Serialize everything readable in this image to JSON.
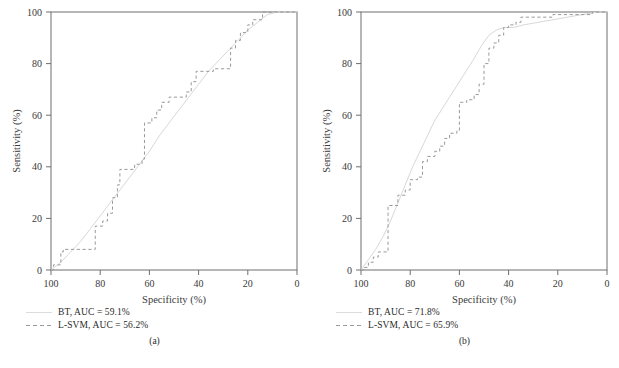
{
  "figure": {
    "background": "#ffffff",
    "axis_color": "#6e6e6e",
    "bt_color": "#d8d8d8",
    "lsvm_color": "#9a9a9a"
  },
  "chart_data": [
    {
      "type": "line",
      "title": "",
      "caption": "(a)",
      "xlabel": "Specificity (%)",
      "ylabel": "Sensitivity (%)",
      "xlim": [
        100,
        0
      ],
      "ylim": [
        0,
        100
      ],
      "xticks": [
        100,
        80,
        60,
        40,
        20,
        0
      ],
      "yticks": [
        0,
        20,
        40,
        60,
        80,
        100
      ],
      "grid": false,
      "legend_position": "below",
      "series": [
        {
          "name": "BT",
          "label": "BT, AUC = 59.1%",
          "auc": 59.1,
          "style": "solid",
          "color": "#d8d8d8",
          "points": [
            [
              100,
              0
            ],
            [
              96,
              3
            ],
            [
              92,
              7
            ],
            [
              88,
              11
            ],
            [
              84,
              16
            ],
            [
              80,
              21
            ],
            [
              76,
              26
            ],
            [
              72,
              31
            ],
            [
              68,
              36
            ],
            [
              64,
              41
            ],
            [
              60,
              46
            ],
            [
              56,
              52
            ],
            [
              52,
              57
            ],
            [
              48,
              62
            ],
            [
              44,
              67
            ],
            [
              40,
              72
            ],
            [
              36,
              77
            ],
            [
              32,
              81
            ],
            [
              28,
              85
            ],
            [
              24,
              89
            ],
            [
              20,
              93
            ],
            [
              16,
              96
            ],
            [
              12,
              99
            ],
            [
              8,
              100
            ],
            [
              4,
              100
            ],
            [
              0,
              100
            ]
          ]
        },
        {
          "name": "L-SVM",
          "label": "L-SVM, AUC = 56.2%",
          "auc": 56.2,
          "style": "dashed",
          "color": "#9a9a9a",
          "points": [
            [
              100,
              0
            ],
            [
              99,
              0
            ],
            [
              99,
              2
            ],
            [
              96,
              2
            ],
            [
              96,
              7
            ],
            [
              95,
              7
            ],
            [
              95,
              8
            ],
            [
              82,
              8
            ],
            [
              82,
              17
            ],
            [
              79,
              17
            ],
            [
              79,
              19
            ],
            [
              77,
              19
            ],
            [
              77,
              22
            ],
            [
              75,
              22
            ],
            [
              75,
              28
            ],
            [
              73,
              28
            ],
            [
              73,
              33
            ],
            [
              72,
              33
            ],
            [
              72,
              39
            ],
            [
              66,
              39
            ],
            [
              66,
              41
            ],
            [
              63,
              41
            ],
            [
              63,
              43
            ],
            [
              62,
              43
            ],
            [
              62,
              57
            ],
            [
              59,
              57
            ],
            [
              59,
              59
            ],
            [
              57,
              59
            ],
            [
              57,
              62
            ],
            [
              55,
              62
            ],
            [
              55,
              65
            ],
            [
              52,
              65
            ],
            [
              52,
              67
            ],
            [
              45,
              67
            ],
            [
              45,
              69
            ],
            [
              43,
              69
            ],
            [
              43,
              73
            ],
            [
              41,
              73
            ],
            [
              41,
              77
            ],
            [
              34,
              77
            ],
            [
              34,
              78
            ],
            [
              27,
              78
            ],
            [
              27,
              86
            ],
            [
              25,
              86
            ],
            [
              25,
              89
            ],
            [
              23,
              89
            ],
            [
              23,
              92
            ],
            [
              20,
              92
            ],
            [
              20,
              95
            ],
            [
              18,
              95
            ],
            [
              18,
              97
            ],
            [
              14,
              97
            ],
            [
              14,
              100
            ],
            [
              0,
              100
            ]
          ]
        }
      ]
    },
    {
      "type": "line",
      "title": "",
      "caption": "(b)",
      "xlabel": "Specificity (%)",
      "ylabel": "Sensitivity (%)",
      "xlim": [
        100,
        0
      ],
      "ylim": [
        0,
        100
      ],
      "xticks": [
        100,
        80,
        60,
        40,
        20,
        0
      ],
      "yticks": [
        0,
        20,
        40,
        60,
        80,
        100
      ],
      "grid": false,
      "legend_position": "below",
      "series": [
        {
          "name": "BT",
          "label": "BT, AUC = 71.8%",
          "auc": 71.8,
          "style": "solid",
          "color": "#d8d8d8",
          "points": [
            [
              100,
              0
            ],
            [
              97,
              4
            ],
            [
              94,
              8
            ],
            [
              91,
              13
            ],
            [
              88,
              19
            ],
            [
              85,
              26
            ],
            [
              82,
              33
            ],
            [
              79,
              40
            ],
            [
              76,
              46
            ],
            [
              73,
              52
            ],
            [
              70,
              58
            ],
            [
              66,
              64
            ],
            [
              62,
              70
            ],
            [
              58,
              76
            ],
            [
              54,
              82
            ],
            [
              51,
              87
            ],
            [
              48,
              91
            ],
            [
              45,
              93
            ],
            [
              42,
              94
            ],
            [
              38,
              94
            ],
            [
              34,
              95
            ],
            [
              28,
              96
            ],
            [
              22,
              97
            ],
            [
              16,
              98
            ],
            [
              10,
              99
            ],
            [
              4,
              100
            ],
            [
              0,
              100
            ]
          ]
        },
        {
          "name": "L-SVM",
          "label": "L-SVM, AUC = 65.9%",
          "auc": 65.9,
          "style": "dashed",
          "color": "#9a9a9a",
          "points": [
            [
              100,
              0
            ],
            [
              99,
              0
            ],
            [
              99,
              1
            ],
            [
              97,
              1
            ],
            [
              97,
              3
            ],
            [
              95,
              3
            ],
            [
              95,
              5
            ],
            [
              93,
              5
            ],
            [
              93,
              7
            ],
            [
              89,
              7
            ],
            [
              89,
              25
            ],
            [
              85,
              25
            ],
            [
              85,
              29
            ],
            [
              82,
              29
            ],
            [
              82,
              31
            ],
            [
              80,
              31
            ],
            [
              80,
              35
            ],
            [
              77,
              35
            ],
            [
              77,
              36
            ],
            [
              75,
              36
            ],
            [
              75,
              42
            ],
            [
              73,
              42
            ],
            [
              73,
              44
            ],
            [
              70,
              44
            ],
            [
              70,
              46
            ],
            [
              68,
              46
            ],
            [
              68,
              48
            ],
            [
              66,
              48
            ],
            [
              66,
              51
            ],
            [
              64,
              51
            ],
            [
              64,
              53
            ],
            [
              61,
              53
            ],
            [
              61,
              54
            ],
            [
              60,
              54
            ],
            [
              60,
              65
            ],
            [
              57,
              65
            ],
            [
              57,
              66
            ],
            [
              54,
              66
            ],
            [
              54,
              68
            ],
            [
              52,
              68
            ],
            [
              52,
              72
            ],
            [
              50,
              72
            ],
            [
              50,
              80
            ],
            [
              48,
              80
            ],
            [
              48,
              86
            ],
            [
              46,
              86
            ],
            [
              46,
              88
            ],
            [
              44,
              88
            ],
            [
              44,
              91
            ],
            [
              42,
              91
            ],
            [
              42,
              94
            ],
            [
              40,
              94
            ],
            [
              40,
              95
            ],
            [
              37,
              95
            ],
            [
              37,
              96
            ],
            [
              35,
              96
            ],
            [
              35,
              98
            ],
            [
              22,
              98
            ],
            [
              22,
              99
            ],
            [
              6,
              99
            ],
            [
              6,
              100
            ],
            [
              0,
              100
            ]
          ]
        }
      ]
    }
  ]
}
